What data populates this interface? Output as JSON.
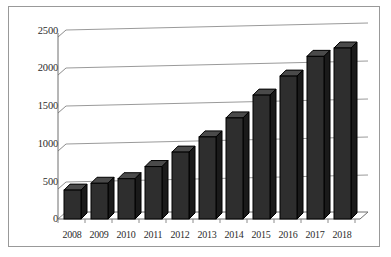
{
  "chart_data": {
    "type": "bar",
    "title": "",
    "subtitle": "",
    "xlabel": "",
    "ylabel": "",
    "categories": [
      "2008",
      "2009",
      "2010",
      "2011",
      "2012",
      "2013",
      "2014",
      "2015",
      "2016",
      "2017",
      "2018"
    ],
    "values": [
      380,
      470,
      530,
      690,
      880,
      1080,
      1330,
      1630,
      1880,
      2140,
      2250
    ],
    "series": [
      {
        "name": "",
        "values": [
          380,
          470,
          530,
          690,
          880,
          1080,
          1330,
          1630,
          1880,
          2140,
          2250
        ]
      }
    ],
    "ylim": [
      0,
      2500
    ],
    "yticks": [
      0,
      500,
      1000,
      1500,
      2000,
      2500
    ],
    "ytick_labels": [
      "0",
      "500",
      "1000",
      "1500",
      "2000",
      "2500"
    ],
    "xtick_labels": [
      "2008",
      "2009",
      "2010",
      "2011",
      "2012",
      "2013",
      "2014",
      "2015",
      "2016",
      "2017",
      "2018"
    ],
    "grid": true,
    "grid_axis": "y",
    "legend": false,
    "legend_position": "none",
    "annotations": [],
    "style": "3d-column",
    "colors": {
      "bar_face": "#2e2e2e",
      "bar_top": "#4a4a4a",
      "bar_side": "#1a1a1a",
      "bar_outline": "#000000",
      "gridline": "#9a9a9a",
      "axis": "#6f6f6f",
      "frame_border": "#999999",
      "background": "#ffffff",
      "text": "#2b2b2b"
    }
  }
}
